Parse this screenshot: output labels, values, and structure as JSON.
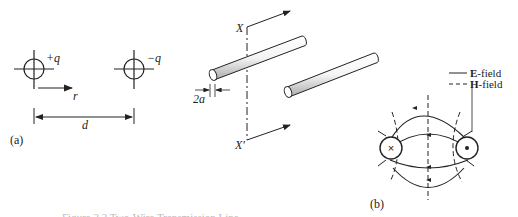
{
  "figure": {
    "caption_partial": "Figure 2.2  Two-Wire Transmission Line",
    "panel_a": {
      "label": "(a)",
      "charge_pos": "+q",
      "charge_neg": "−q",
      "radial_label": "r",
      "separation_label": "d"
    },
    "wires": {
      "axis_top": "X",
      "axis_bottom": "X′",
      "diameter_label": "2a"
    },
    "panel_b": {
      "label": "(b)",
      "legend": [
        {
          "line": "solid",
          "bold": "E",
          "text": "-field"
        },
        {
          "line": "dashed",
          "bold": "H",
          "text": "-field"
        }
      ],
      "left_conductor_symbol": "×",
      "right_conductor_symbol": "•"
    }
  }
}
